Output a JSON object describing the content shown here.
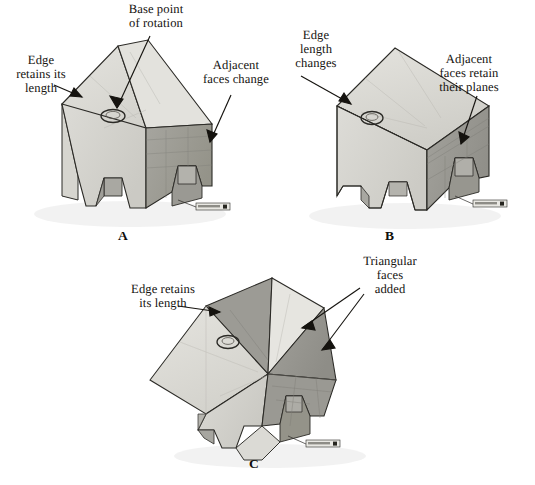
{
  "figure": {
    "domain": "technical-illustration",
    "palette": {
      "face_top_light": "#dddcd7",
      "face_front_light": "#d2d1cb",
      "face_side_dark": "#9d9c96",
      "face_shadow": "#8a8984",
      "face_highlight": "#e8e7e2",
      "outline": "#2b2a26",
      "text": "#15130f",
      "background": "#ffffff"
    },
    "panels": [
      {
        "id": "a",
        "letter": "A",
        "callouts": [
          {
            "name": "base-point-of-rotation",
            "text": "Base point\nof rotation"
          },
          {
            "name": "edge-retains-its-length",
            "text": "Edge\nretains its\nlength"
          },
          {
            "name": "adjacent-faces-change",
            "text": "Adjacent\nfaces change"
          }
        ]
      },
      {
        "id": "b",
        "letter": "B",
        "callouts": [
          {
            "name": "edge-length-changes",
            "text": "Edge\nlength\nchanges"
          },
          {
            "name": "adjacent-faces-retain-their-planes",
            "text": "Adjacent\nfaces retain\ntheir planes"
          }
        ]
      },
      {
        "id": "c",
        "letter": "C",
        "callouts": [
          {
            "name": "edge-retains-its-length",
            "text": "Edge retains\nits length"
          },
          {
            "name": "triangular-faces-added",
            "text": "Triangular\nfaces\nadded"
          }
        ]
      }
    ]
  }
}
